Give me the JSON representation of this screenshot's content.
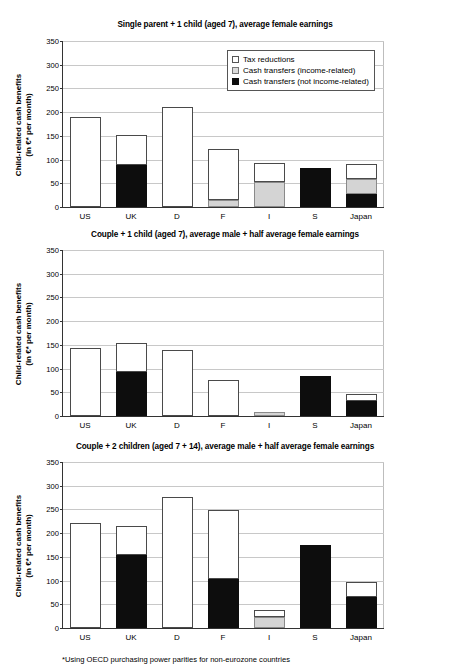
{
  "footnote": "*Using OECD purchasing power parities for non-eurozone countries",
  "axis": {
    "ylabel_line1": "Child-related cash benefits",
    "ylabel_line2": "(in €* per month)",
    "yticks": [
      "0",
      "50",
      "100",
      "150",
      "200",
      "250",
      "300",
      "350"
    ]
  },
  "legend": {
    "items": [
      {
        "label": "Tax reductions",
        "swatch": "white",
        "color": "#ffffff"
      },
      {
        "label": "Cash transfers (income-related)",
        "swatch": "gray",
        "color": "#d4d4d4"
      },
      {
        "label": "Cash transfers (not income-related)",
        "swatch": "black",
        "color": "#0d0d0d"
      }
    ]
  },
  "chart_data": [
    {
      "type": "bar",
      "title": "Single parent + 1 child (aged 7), average female earnings",
      "xlabel": "",
      "ylabel": "Child-related cash benefits (in €* per month)",
      "ylim": [
        0,
        350
      ],
      "ytick_step": 50,
      "grid": true,
      "legend_position": "top-right",
      "stacked": true,
      "categories": [
        "US",
        "UK",
        "D",
        "F",
        "I",
        "S",
        "Japan"
      ],
      "series": [
        {
          "name": "Cash transfers (not income-related)",
          "values": [
            0,
            89,
            0,
            0,
            0,
            81,
            28
          ]
        },
        {
          "name": "Cash transfers (income-related)",
          "values": [
            0,
            0,
            0,
            15,
            52,
            0,
            30
          ]
        },
        {
          "name": "Tax reductions",
          "values": [
            189,
            61,
            209,
            107,
            41,
            0,
            33
          ]
        }
      ],
      "totals": [
        189,
        150,
        209,
        122,
        93,
        81,
        91
      ]
    },
    {
      "type": "bar",
      "title": "Couple + 1 child (aged 7), average male + half average female earnings",
      "xlabel": "",
      "ylabel": "Child-related cash benefits (in €* per month)",
      "ylim": [
        0,
        350
      ],
      "ytick_step": 50,
      "grid": true,
      "legend_position": "none",
      "stacked": true,
      "categories": [
        "US",
        "UK",
        "D",
        "F",
        "I",
        "S",
        "Japan"
      ],
      "series": [
        {
          "name": "Cash transfers (not income-related)",
          "values": [
            0,
            92,
            0,
            0,
            0,
            84,
            31
          ]
        },
        {
          "name": "Cash transfers (income-related)",
          "values": [
            0,
            0,
            0,
            0,
            9,
            0,
            0
          ]
        },
        {
          "name": "Tax reductions",
          "values": [
            142,
            60,
            138,
            75,
            0,
            0,
            16
          ]
        }
      ],
      "totals": [
        142,
        152,
        138,
        75,
        9,
        84,
        47
      ]
    },
    {
      "type": "bar",
      "title": "Couple + 2 children (aged 7 + 14), average male + half average female earnings",
      "xlabel": "",
      "ylabel": "Child-related cash benefits (in €* per month)",
      "ylim": [
        0,
        350
      ],
      "ytick_step": 50,
      "grid": true,
      "legend_position": "none",
      "stacked": true,
      "categories": [
        "US",
        "UK",
        "D",
        "F",
        "I",
        "S",
        "Japan"
      ],
      "series": [
        {
          "name": "Cash transfers (not income-related)",
          "values": [
            0,
            153,
            0,
            103,
            0,
            173,
            65
          ]
        },
        {
          "name": "Cash transfers (income-related)",
          "values": [
            0,
            0,
            0,
            0,
            24,
            0,
            0
          ]
        },
        {
          "name": "Tax reductions",
          "values": [
            221,
            60,
            275,
            145,
            14,
            0,
            31
          ]
        }
      ],
      "totals": [
        221,
        213,
        275,
        248,
        38,
        173,
        96
      ]
    }
  ]
}
